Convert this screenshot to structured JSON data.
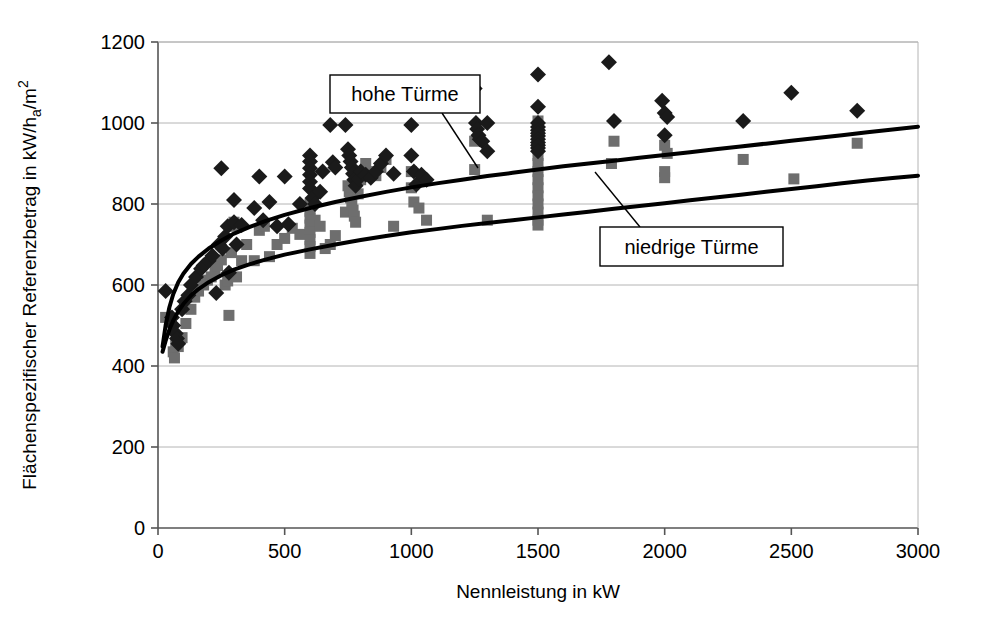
{
  "chart_data": {
    "type": "scatter",
    "title": "",
    "xlabel": "Nennleistung in kW",
    "ylabel_parts": {
      "main_a": "Flächenspezifischer Referenzbetrag in kW/h",
      "sub": "a",
      "main_b": "/m",
      "sup": "2"
    },
    "ylabel": "Flächenspezifischer Referenzbetrag in kW/h_a/m²",
    "xlim": [
      0,
      3000
    ],
    "ylim": [
      0,
      1200
    ],
    "xticks": [
      0,
      500,
      1000,
      1500,
      2000,
      2500,
      3000
    ],
    "yticks": [
      0,
      200,
      400,
      600,
      800,
      1000,
      1200
    ],
    "xtick_labels": [
      "0",
      "500",
      "1000",
      "1500",
      "2000",
      "2500",
      "3000"
    ],
    "ytick_labels": [
      "0",
      "200",
      "400",
      "600",
      "800",
      "1000",
      "1200"
    ],
    "grid": true,
    "grid_axis": "y",
    "legend_position": "none",
    "annotations": [
      {
        "name": "hohe-tuerme",
        "text": "hohe Türme",
        "box": {
          "x": 330,
          "y": 75,
          "w": 150,
          "h": 38
        },
        "leader_from": [
          442,
          113
        ],
        "leader_to": [
          478,
          168
        ]
      },
      {
        "name": "niedrige-tuerme",
        "text": "niedrige Türme",
        "box": {
          "x": 600,
          "y": 227,
          "w": 183,
          "h": 39
        },
        "leader_from": [
          640,
          227
        ],
        "leader_to": [
          595,
          172
        ]
      }
    ],
    "series": [
      {
        "name": "hohe Türme",
        "marker": "diamond",
        "color": "#1a1a1a",
        "points": [
          [
            30,
            585
          ],
          [
            55,
            520
          ],
          [
            60,
            500
          ],
          [
            70,
            480
          ],
          [
            75,
            468
          ],
          [
            80,
            455
          ],
          [
            95,
            540
          ],
          [
            105,
            560
          ],
          [
            120,
            575
          ],
          [
            130,
            600
          ],
          [
            150,
            620
          ],
          [
            170,
            640
          ],
          [
            180,
            648
          ],
          [
            200,
            660
          ],
          [
            215,
            672
          ],
          [
            230,
            580
          ],
          [
            240,
            700
          ],
          [
            250,
            888
          ],
          [
            255,
            690
          ],
          [
            265,
            720
          ],
          [
            275,
            745
          ],
          [
            280,
            630
          ],
          [
            300,
            810
          ],
          [
            300,
            755
          ],
          [
            310,
            700
          ],
          [
            330,
            748
          ],
          [
            380,
            790
          ],
          [
            400,
            868
          ],
          [
            415,
            760
          ],
          [
            440,
            805
          ],
          [
            470,
            745
          ],
          [
            500,
            868
          ],
          [
            515,
            750
          ],
          [
            560,
            800
          ],
          [
            600,
            920
          ],
          [
            600,
            905
          ],
          [
            600,
            888
          ],
          [
            600,
            872
          ],
          [
            600,
            855
          ],
          [
            600,
            838
          ],
          [
            610,
            815
          ],
          [
            620,
            800
          ],
          [
            640,
            830
          ],
          [
            650,
            880
          ],
          [
            680,
            995
          ],
          [
            690,
            903
          ],
          [
            700,
            890
          ],
          [
            740,
            995
          ],
          [
            750,
            935
          ],
          [
            755,
            920
          ],
          [
            760,
            905
          ],
          [
            765,
            890
          ],
          [
            770,
            875
          ],
          [
            775,
            860
          ],
          [
            780,
            845
          ],
          [
            790,
            862
          ],
          [
            800,
            880
          ],
          [
            820,
            872
          ],
          [
            840,
            865
          ],
          [
            860,
            880
          ],
          [
            880,
            900
          ],
          [
            900,
            920
          ],
          [
            930,
            875
          ],
          [
            1000,
            995
          ],
          [
            1000,
            920
          ],
          [
            1010,
            880
          ],
          [
            1020,
            848
          ],
          [
            1040,
            872
          ],
          [
            1060,
            860
          ],
          [
            1250,
            1085
          ],
          [
            1255,
            1000
          ],
          [
            1260,
            985
          ],
          [
            1265,
            970
          ],
          [
            1270,
            960
          ],
          [
            1280,
            955
          ],
          [
            1300,
            1000
          ],
          [
            1300,
            930
          ],
          [
            1500,
            1120
          ],
          [
            1500,
            1040
          ],
          [
            1500,
            1000
          ],
          [
            1500,
            990
          ],
          [
            1500,
            982
          ],
          [
            1500,
            975
          ],
          [
            1500,
            968
          ],
          [
            1500,
            960
          ],
          [
            1500,
            952
          ],
          [
            1500,
            945
          ],
          [
            1500,
            938
          ],
          [
            1500,
            930
          ],
          [
            1780,
            1150
          ],
          [
            1800,
            1005
          ],
          [
            1990,
            1055
          ],
          [
            2000,
            1025
          ],
          [
            2010,
            1015
          ],
          [
            2000,
            970
          ],
          [
            2310,
            1005
          ],
          [
            2500,
            1075
          ],
          [
            2760,
            1030
          ]
        ]
      },
      {
        "name": "niedrige Türme",
        "marker": "square",
        "color": "#6e6e6e",
        "points": [
          [
            30,
            520
          ],
          [
            50,
            510
          ],
          [
            60,
            435
          ],
          [
            65,
            420
          ],
          [
            70,
            455
          ],
          [
            80,
            448
          ],
          [
            95,
            470
          ],
          [
            110,
            505
          ],
          [
            130,
            540
          ],
          [
            145,
            570
          ],
          [
            160,
            585
          ],
          [
            180,
            600
          ],
          [
            195,
            612
          ],
          [
            210,
            620
          ],
          [
            225,
            635
          ],
          [
            235,
            648
          ],
          [
            250,
            662
          ],
          [
            265,
            600
          ],
          [
            275,
            610
          ],
          [
            280,
            525
          ],
          [
            290,
            680
          ],
          [
            295,
            745
          ],
          [
            300,
            755
          ],
          [
            310,
            620
          ],
          [
            330,
            660
          ],
          [
            350,
            700
          ],
          [
            380,
            660
          ],
          [
            400,
            735
          ],
          [
            420,
            745
          ],
          [
            440,
            670
          ],
          [
            470,
            700
          ],
          [
            500,
            715
          ],
          [
            530,
            740
          ],
          [
            560,
            725
          ],
          [
            600,
            800
          ],
          [
            600,
            782
          ],
          [
            600,
            765
          ],
          [
            600,
            748
          ],
          [
            600,
            730
          ],
          [
            600,
            712
          ],
          [
            600,
            695
          ],
          [
            600,
            678
          ],
          [
            620,
            760
          ],
          [
            640,
            745
          ],
          [
            660,
            690
          ],
          [
            680,
            700
          ],
          [
            700,
            722
          ],
          [
            740,
            780
          ],
          [
            750,
            845
          ],
          [
            755,
            830
          ],
          [
            760,
            815
          ],
          [
            765,
            800
          ],
          [
            770,
            785
          ],
          [
            775,
            770
          ],
          [
            780,
            755
          ],
          [
            790,
            825
          ],
          [
            800,
            860
          ],
          [
            820,
            900
          ],
          [
            840,
            880
          ],
          [
            860,
            870
          ],
          [
            880,
            890
          ],
          [
            900,
            910
          ],
          [
            930,
            745
          ],
          [
            1000,
            880
          ],
          [
            1000,
            840
          ],
          [
            1010,
            805
          ],
          [
            1030,
            790
          ],
          [
            1060,
            760
          ],
          [
            1250,
            955
          ],
          [
            1250,
            885
          ],
          [
            1300,
            760
          ],
          [
            1500,
            1005
          ],
          [
            1500,
            955
          ],
          [
            1500,
            960
          ],
          [
            1500,
            940
          ],
          [
            1500,
            920
          ],
          [
            1500,
            900
          ],
          [
            1500,
            880
          ],
          [
            1500,
            860
          ],
          [
            1500,
            840
          ],
          [
            1500,
            820
          ],
          [
            1500,
            800
          ],
          [
            1500,
            780
          ],
          [
            1500,
            760
          ],
          [
            1500,
            748
          ],
          [
            1790,
            900
          ],
          [
            1800,
            955
          ],
          [
            2000,
            945
          ],
          [
            2010,
            925
          ],
          [
            2000,
            880
          ],
          [
            2000,
            865
          ],
          [
            2310,
            910
          ],
          [
            2510,
            862
          ],
          [
            2760,
            950
          ]
        ]
      }
    ],
    "curves": [
      {
        "name": "hohe Türme trend",
        "color": "#000000",
        "width": 4,
        "points": [
          [
            18,
            448
          ],
          [
            30,
            500
          ],
          [
            45,
            545
          ],
          [
            60,
            577
          ],
          [
            80,
            607
          ],
          [
            100,
            628
          ],
          [
            130,
            652
          ],
          [
            160,
            670
          ],
          [
            200,
            690
          ],
          [
            250,
            710
          ],
          [
            300,
            727
          ],
          [
            360,
            743
          ],
          [
            420,
            757
          ],
          [
            500,
            773
          ],
          [
            600,
            790
          ],
          [
            700,
            805
          ],
          [
            800,
            818
          ],
          [
            900,
            830
          ],
          [
            1000,
            841
          ],
          [
            1100,
            851
          ],
          [
            1200,
            860
          ],
          [
            1300,
            869
          ],
          [
            1400,
            877
          ],
          [
            1500,
            885
          ],
          [
            1600,
            893
          ],
          [
            1700,
            900
          ],
          [
            1800,
            907
          ],
          [
            1900,
            914
          ],
          [
            2000,
            921
          ],
          [
            2100,
            928
          ],
          [
            2200,
            935
          ],
          [
            2300,
            942
          ],
          [
            2400,
            949
          ],
          [
            2500,
            956
          ],
          [
            2600,
            963
          ],
          [
            2700,
            970
          ],
          [
            2800,
            977
          ],
          [
            2900,
            984
          ],
          [
            3000,
            991
          ]
        ]
      },
      {
        "name": "niedrige Türme trend",
        "color": "#000000",
        "width": 4,
        "points": [
          [
            18,
            435
          ],
          [
            30,
            462
          ],
          [
            45,
            490
          ],
          [
            60,
            512
          ],
          [
            80,
            535
          ],
          [
            100,
            553
          ],
          [
            130,
            574
          ],
          [
            160,
            590
          ],
          [
            200,
            607
          ],
          [
            250,
            624
          ],
          [
            300,
            638
          ],
          [
            360,
            651
          ],
          [
            420,
            662
          ],
          [
            500,
            675
          ],
          [
            600,
            688
          ],
          [
            700,
            700
          ],
          [
            800,
            711
          ],
          [
            900,
            721
          ],
          [
            1000,
            730
          ],
          [
            1100,
            738
          ],
          [
            1200,
            746
          ],
          [
            1300,
            753
          ],
          [
            1400,
            760
          ],
          [
            1500,
            767
          ],
          [
            1600,
            774
          ],
          [
            1700,
            781
          ],
          [
            1800,
            788
          ],
          [
            1900,
            795
          ],
          [
            2000,
            802
          ],
          [
            2100,
            809
          ],
          [
            2200,
            816
          ],
          [
            2300,
            823
          ],
          [
            2400,
            830
          ],
          [
            2500,
            837
          ],
          [
            2600,
            844
          ],
          [
            2700,
            851
          ],
          [
            2800,
            858
          ],
          [
            2900,
            864
          ],
          [
            3000,
            870
          ]
        ]
      }
    ],
    "colors": {
      "diamond_marker": "#1a1a1a",
      "square_marker": "#6e6e6e",
      "trend_line": "#000000",
      "grid_line": "#b4b4b4",
      "axis_line": "#555555",
      "background": "#ffffff"
    }
  },
  "plot_geometry": {
    "left": 158,
    "right": 918,
    "top": 42,
    "bottom": 528
  }
}
